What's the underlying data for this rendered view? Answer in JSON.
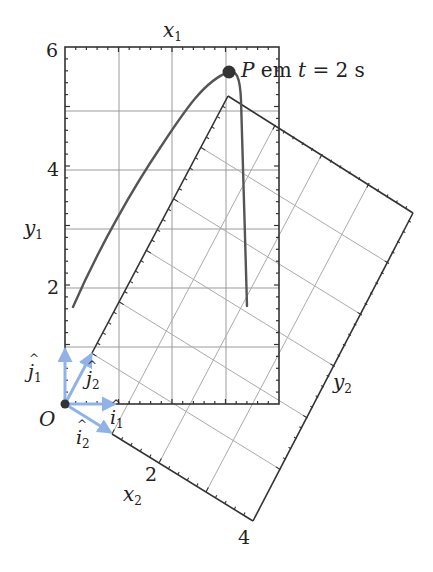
{
  "figure": {
    "width": 433,
    "height": 572,
    "colors": {
      "frame": "#333333",
      "grid": "#9a9a9a",
      "grid_rotated": "#aaaaaa",
      "curve": "#555555",
      "point": "#333333",
      "unit_vectors": "#8fb3e8",
      "text": "#222222"
    },
    "frame1": {
      "axis_x_label": "x",
      "axis_x_sub": "1",
      "axis_y_label": "y",
      "axis_y_sub": "1",
      "x_range": [
        0,
        4
      ],
      "y_range": [
        0,
        6
      ],
      "y_tick_labels": [
        "2",
        "4",
        "6"
      ],
      "pixel_box": {
        "left": 65,
        "right": 279,
        "top": 47,
        "bottom": 404
      }
    },
    "frame2": {
      "axis_x_label": "x",
      "axis_x_sub": "2",
      "axis_y_label": "y",
      "axis_y_sub": "2",
      "x_range": [
        0,
        4
      ],
      "y_range": [
        0,
        6
      ],
      "x_tick_labels": [
        "2",
        "4"
      ]
    },
    "origin": {
      "label": "O"
    },
    "unit_vectors": [
      {
        "name": "j1",
        "letter": "j",
        "sub": "1"
      },
      {
        "name": "i1",
        "letter": "i",
        "sub": "1"
      },
      {
        "name": "j2",
        "letter": "j",
        "sub": "2"
      },
      {
        "name": "i2",
        "letter": "i",
        "sub": "2"
      }
    ],
    "point": {
      "label": "P",
      "caption_middle": " em ",
      "caption_var": "t",
      "caption_eq": " = 2 s"
    }
  }
}
